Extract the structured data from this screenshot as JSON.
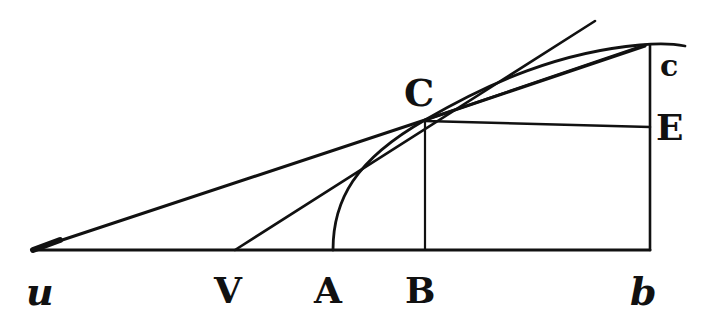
{
  "diagram": {
    "type": "geometric-construction",
    "stroke_color": "#111111",
    "background": "#ffffff",
    "points": {
      "u": {
        "label": "u",
        "x": 35,
        "y": 250,
        "italic": true
      },
      "V": {
        "label": "V",
        "x": 235,
        "y": 250
      },
      "A": {
        "label": "A",
        "x": 333,
        "y": 250
      },
      "B": {
        "label": "B",
        "x": 425,
        "y": 250
      },
      "b": {
        "label": "b",
        "x": 650,
        "y": 250,
        "italic": true
      },
      "C": {
        "label": "C",
        "x": 425,
        "y": 120
      },
      "E": {
        "label": "E",
        "x": 650,
        "y": 127
      },
      "c": {
        "label": "c",
        "x": 645,
        "y": 45
      }
    },
    "labels": {
      "u": "u",
      "V": "V",
      "A": "A",
      "B": "B",
      "b": "b",
      "C": "C",
      "E": "E",
      "c": "c"
    },
    "elements": [
      {
        "name": "baseline",
        "from": "u",
        "to": "b"
      },
      {
        "name": "ordinate-BC",
        "from": "B",
        "to": "C"
      },
      {
        "name": "ordinate-bc",
        "from": "b",
        "to": "c"
      },
      {
        "name": "segment-CE",
        "from": "C",
        "to": "E"
      },
      {
        "name": "secant-uc",
        "from": "u",
        "to": "c"
      },
      {
        "name": "tangent-VC",
        "from": "V",
        "to": "C",
        "extended": true
      },
      {
        "name": "chord-Cc",
        "from": "C",
        "to": "c"
      },
      {
        "name": "curve-AC-c",
        "through": [
          "A",
          "C",
          "c"
        ]
      }
    ]
  }
}
